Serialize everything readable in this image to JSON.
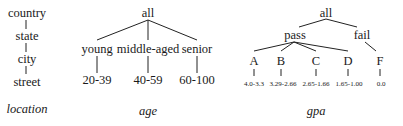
{
  "location": {
    "levels": [
      "country",
      "state",
      "city",
      "street"
    ],
    "caption": "location"
  },
  "age": {
    "root": "all",
    "groups": [
      {
        "label": "young",
        "range": "20-39"
      },
      {
        "label": "middle-aged",
        "range": "40-59"
      },
      {
        "label": "senior",
        "range": "60-100"
      }
    ],
    "caption": "age"
  },
  "gpa": {
    "root": "all",
    "categories": [
      {
        "label": "pass",
        "grades": [
          {
            "label": "A",
            "range": "4.0-3.3"
          },
          {
            "label": "B",
            "range": "3.29-2.66"
          },
          {
            "label": "C",
            "range": "2.65-1.66"
          },
          {
            "label": "D",
            "range": "1.65-1.00"
          }
        ]
      },
      {
        "label": "fail",
        "grades": [
          {
            "label": "F",
            "range": "0.0"
          }
        ]
      }
    ],
    "caption": "gpa"
  }
}
